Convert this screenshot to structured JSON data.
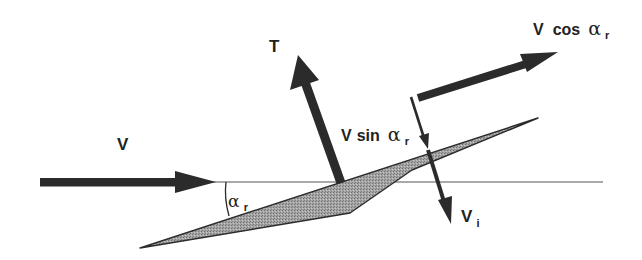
{
  "diagram": {
    "title": "",
    "type": "blade element velocity diagram",
    "colors": {
      "arrow": "#2b2b2b",
      "blade_fill": "#9a9a9a",
      "blade_stroke": "#2b2b2b",
      "reference_line": "#555555",
      "text": "#222222",
      "background": "#ffffff"
    },
    "labels": {
      "thrust": "T",
      "velocity": "V",
      "v_sin_prefix": "V",
      "v_sin_fn": "sin",
      "v_cos_prefix": "V",
      "v_cos_fn": "cos",
      "alpha": "α",
      "alpha_sub": "r",
      "vi_main": "V",
      "vi_sub": "i",
      "angle_main": "α",
      "angle_sub": "r"
    },
    "elements": [
      {
        "name": "V",
        "kind": "arrow",
        "direction": "horizontal right"
      },
      {
        "name": "T",
        "kind": "arrow",
        "direction": "perpendicular to blade, upward"
      },
      {
        "name": "V cos αr",
        "kind": "arrow",
        "direction": "parallel to blade"
      },
      {
        "name": "V sin αr",
        "kind": "arrow",
        "direction": "perpendicular to blade, downward"
      },
      {
        "name": "Vi",
        "kind": "arrow",
        "direction": "downward through blade"
      },
      {
        "name": "αr",
        "kind": "angle",
        "between": "horizontal line and blade chord"
      }
    ]
  }
}
